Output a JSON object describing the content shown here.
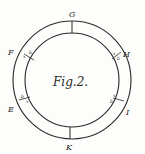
{
  "figure": {
    "title": "Fig.2.",
    "ink_color": "#2a2a2a",
    "paper_color": "#fdfdfb",
    "points": {
      "G": "G",
      "H": "H",
      "I": "I",
      "K": "K",
      "E": "E",
      "F": "F"
    },
    "small_marks": {
      "F_b": "b",
      "F_x": "x",
      "H_x": "x",
      "H_b": "b",
      "E_b": "b",
      "E_x": "x",
      "I_x": "x",
      "I_b": "b"
    }
  }
}
